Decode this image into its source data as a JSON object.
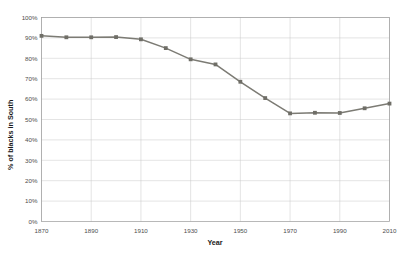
{
  "chart_data": {
    "type": "line",
    "title": "",
    "xlabel": "Year",
    "ylabel": "% of blacks in South",
    "xlim": [
      1870,
      2010
    ],
    "ylim": [
      0,
      100
    ],
    "grid": true,
    "legend": "none",
    "y_tick_labels": [
      "0%",
      "10%",
      "20%",
      "30%",
      "40%",
      "50%",
      "60%",
      "70%",
      "80%",
      "90%",
      "100%"
    ],
    "y_tick_values": [
      0,
      10,
      20,
      30,
      40,
      50,
      60,
      70,
      80,
      90,
      100
    ],
    "x_tick_labels": [
      "1870",
      "1890",
      "1910",
      "1930",
      "1950",
      "1970",
      "1990",
      "2010"
    ],
    "x_tick_values": [
      1870,
      1890,
      1910,
      1930,
      1950,
      1970,
      1990,
      2010
    ],
    "series": [
      {
        "name": "% of blacks in South",
        "color": "#7c7b74",
        "marker": "square",
        "x": [
          1870,
          1880,
          1890,
          1900,
          1910,
          1920,
          1930,
          1940,
          1950,
          1960,
          1970,
          1980,
          1990,
          2000,
          2010
        ],
        "values": [
          91,
          90.3,
          90.3,
          90.4,
          89.3,
          85,
          79.5,
          77,
          68.5,
          60.5,
          53,
          53.3,
          53.2,
          55.5,
          57.8
        ]
      }
    ]
  }
}
